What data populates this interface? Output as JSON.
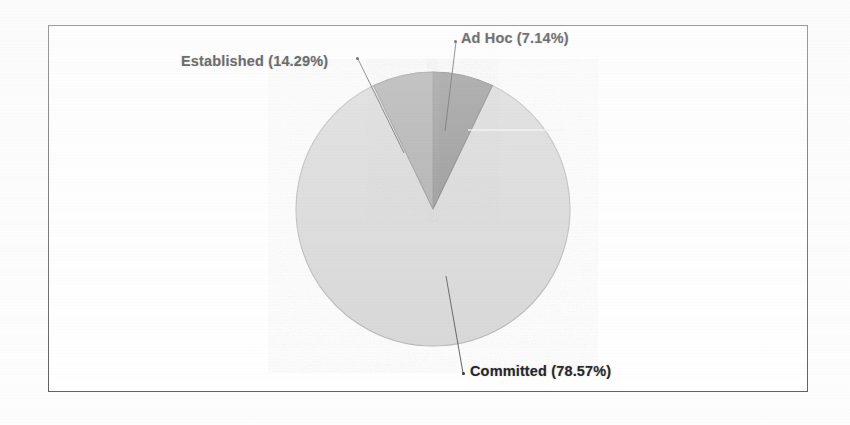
{
  "chart_data": {
    "type": "pie",
    "title": "",
    "subtitle": "",
    "xlabel": "",
    "ylabel": "",
    "legend_position": "none",
    "grid": false,
    "labels": [
      "Ad Hoc",
      "Established",
      "Committed"
    ],
    "values": [
      7.14,
      14.29,
      78.57
    ],
    "value_unit": "%",
    "start_angle_deg": 0,
    "direction": "clockwise",
    "slices": [
      {
        "name": "Ad Hoc",
        "percent": 7.14,
        "label_text": "Ad  Hoc (7.14%)",
        "color": "#8a8a8a",
        "start_deg": 0,
        "end_deg": 25.7
      },
      {
        "name": "Established",
        "percent": 14.29,
        "label_text": "Established (14.29%)",
        "color": "#a6a6a6",
        "start_deg": 334.3,
        "end_deg": 360
      },
      {
        "name": "Committed",
        "percent": 78.57,
        "label_text": "Committed (78.57%)",
        "color": "#d6d6d6",
        "start_deg": 25.7,
        "end_deg": 334.3
      }
    ]
  },
  "figure": {
    "frame_color": "#5c5c5c",
    "background_color": "#ffffff",
    "page_background": "#fdfdfd",
    "pie_outline_color": "#b0b0b0",
    "leader_line_color": "#4a4a4a"
  },
  "labels": {
    "established": "Established (14.29%)",
    "ad_hoc": "Ad  Hoc (7.14%)",
    "committed": "Committed (78.57%)"
  }
}
